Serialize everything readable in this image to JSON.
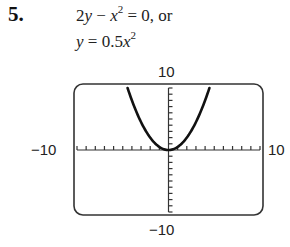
{
  "problem": {
    "number": "5.",
    "equation_line1": {
      "a": "2",
      "y": "y",
      "minus": " − ",
      "x": "x",
      "exp": "2",
      "rest": " = 0, or"
    },
    "equation_line2": {
      "y": "y",
      "eq": " = 0.5",
      "x": "x",
      "exp": "2"
    }
  },
  "graph": {
    "labels": {
      "ymax": "10",
      "ymin": "−10",
      "xmin": "−10",
      "xmax": "10"
    },
    "colors": {
      "frame": "#333333",
      "curve": "#111111",
      "axis": "#333333"
    }
  },
  "chart_data": {
    "type": "line",
    "title": "",
    "function": "y = 0.5x^2",
    "xlabel": "",
    "ylabel": "",
    "xlim": [
      -10,
      10
    ],
    "ylim": [
      -10,
      10
    ],
    "xscale": 1,
    "yscale": 1,
    "grid": false,
    "tick_labels": {
      "x": [
        "-10",
        "10"
      ],
      "y": [
        "-10",
        "10"
      ]
    },
    "series": [
      {
        "name": "y = 0.5x^2",
        "x": [
          -4.47,
          -4,
          -3,
          -2,
          -1,
          0,
          1,
          2,
          3,
          4,
          4.47
        ],
        "y": [
          10,
          8,
          4.5,
          2,
          0.5,
          0,
          0.5,
          2,
          4.5,
          8,
          10
        ]
      }
    ]
  }
}
